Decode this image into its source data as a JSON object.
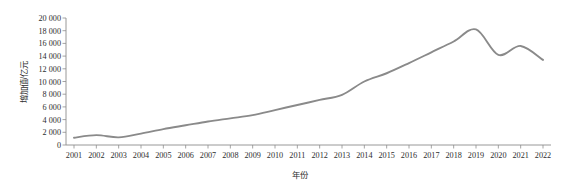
{
  "chart_data": {
    "type": "line",
    "title": "",
    "xlabel": "年份",
    "ylabel": "增加值/亿元",
    "x": [
      2001,
      2002,
      2003,
      2004,
      2005,
      2006,
      2007,
      2008,
      2009,
      2010,
      2011,
      2012,
      2013,
      2014,
      2015,
      2016,
      2017,
      2018,
      2019,
      2020,
      2021,
      2022
    ],
    "categories": [
      "2001",
      "2002",
      "2003",
      "2004",
      "2005",
      "2006",
      "2007",
      "2008",
      "2009",
      "2010",
      "2011",
      "2012",
      "2013",
      "2014",
      "2015",
      "2016",
      "2017",
      "2018",
      "2019",
      "2020",
      "2021",
      "2022"
    ],
    "values": [
      1150,
      1550,
      1200,
      1800,
      2500,
      3100,
      3700,
      4200,
      4700,
      5500,
      6300,
      7100,
      7900,
      10000,
      11300,
      12900,
      14600,
      16300,
      18200,
      14200,
      15600,
      13400
    ],
    "series": [
      {
        "name": "增加值",
        "color": "#8a8a8a",
        "values": [
          1150,
          1550,
          1200,
          1800,
          2500,
          3100,
          3700,
          4200,
          4700,
          5500,
          6300,
          7100,
          7900,
          10000,
          11300,
          12900,
          14600,
          16300,
          18200,
          14200,
          15600,
          13400
        ]
      }
    ],
    "ylim": [
      0,
      20000
    ],
    "ytick_step": 2000,
    "ytick_labels": [
      "0",
      "2 000",
      "4 000",
      "6 000",
      "8 000",
      "10 000",
      "12 000",
      "14 000",
      "16 000",
      "18 000",
      "20 000"
    ],
    "ytick_values": [
      0,
      2000,
      4000,
      6000,
      8000,
      10000,
      12000,
      14000,
      16000,
      18000,
      20000
    ],
    "grid": false,
    "legend": "none",
    "line_color": "#8a8a8a",
    "axis_color": "#8d8d8d",
    "background_color": "#ffffff"
  }
}
